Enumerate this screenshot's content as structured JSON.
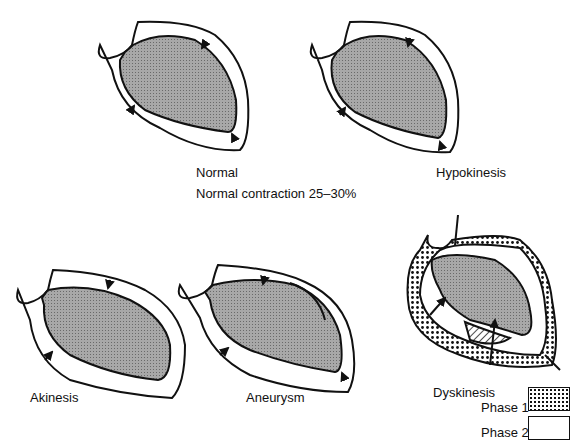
{
  "figure": {
    "panels": [
      {
        "id": "normal",
        "label": "Normal",
        "sublabel": "Normal contraction 25–30%"
      },
      {
        "id": "hypokinesis",
        "label": "Hypokinesis"
      },
      {
        "id": "akinesis",
        "label": "Akinesis"
      },
      {
        "id": "aneurysm",
        "label": "Aneurysm"
      },
      {
        "id": "dyskinesis",
        "label": "Dyskinesis"
      }
    ],
    "legend": [
      {
        "label": "Phase 1",
        "pattern": "dotted"
      },
      {
        "label": "Phase 2",
        "pattern": "blank"
      }
    ],
    "colors": {
      "fill": "#9a9a9a",
      "stroke": "#111111",
      "background": "#ffffff"
    }
  }
}
